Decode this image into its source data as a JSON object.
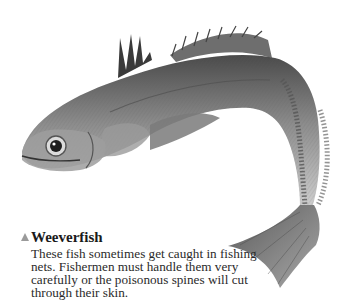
{
  "figure": {
    "colors": {
      "body_dark": "#3c3c3c",
      "body_mid": "#8a8a8a",
      "body_light": "#c8c8c8",
      "background": "#ffffff",
      "marker": "#9a9a9a"
    }
  },
  "caption": {
    "marker_icon": "triangle-up-icon",
    "title": "Weeverfish",
    "body": "These fish sometimes get caught in fishing nets. Fishermen must handle them very carefully or the poisonous spines will cut through their skin."
  }
}
